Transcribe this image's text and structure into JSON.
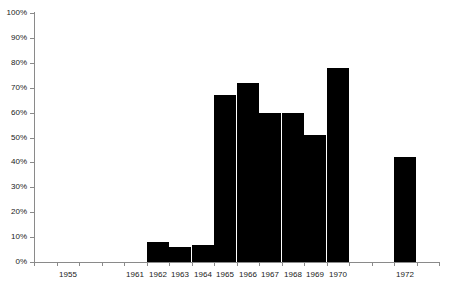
{
  "chart_data": {
    "type": "bar",
    "title": "",
    "subtitle": "",
    "xlabel": "",
    "ylabel": "",
    "grid": false,
    "legend": "none",
    "ylim": [
      0,
      100
    ],
    "y_unit": "%",
    "y_ticks": [
      "0%",
      "10%",
      "20%",
      "30%",
      "40%",
      "50%",
      "60%",
      "70%",
      "80%",
      "90%",
      "100%"
    ],
    "y_tick_values": [
      0,
      10,
      20,
      30,
      40,
      50,
      60,
      70,
      80,
      90,
      100
    ],
    "categories": [
      "1955",
      "1961",
      "1962",
      "1963",
      "1964",
      "1965",
      "1966",
      "1967",
      "1968",
      "1969",
      "1970",
      "1972"
    ],
    "values": [
      0,
      0,
      8,
      6,
      7,
      67,
      72,
      60,
      60,
      51,
      78,
      42
    ],
    "bars": [
      {
        "category": "1955",
        "value": 0,
        "label": "0%",
        "has_bar": false
      },
      {
        "category": "1961",
        "value": 0,
        "label": "0%",
        "has_bar": false
      },
      {
        "category": "1962",
        "value": 8,
        "label": "8%",
        "has_bar": true
      },
      {
        "category": "1963",
        "value": 6,
        "label": "6%",
        "has_bar": true
      },
      {
        "category": "1964",
        "value": 7,
        "label": "7%",
        "has_bar": true
      },
      {
        "category": "1965",
        "value": 67,
        "label": "67%",
        "has_bar": true
      },
      {
        "category": "1966",
        "value": 72,
        "label": "72%",
        "has_bar": true
      },
      {
        "category": "1967",
        "value": 60,
        "label": "60%",
        "has_bar": true
      },
      {
        "category": "1968",
        "value": 60,
        "label": "60%",
        "has_bar": true
      },
      {
        "category": "1969",
        "value": 51,
        "label": "51%",
        "has_bar": true
      },
      {
        "category": "1970",
        "value": 78,
        "label": "78%",
        "has_bar": true
      },
      {
        "category": "1972",
        "value": 42,
        "label": "42%",
        "has_bar": true
      }
    ],
    "hidden_tick_slots": 6,
    "series": [
      {
        "name": "",
        "values": [
          0,
          0,
          8,
          6,
          7,
          67,
          72,
          60,
          60,
          51,
          78,
          42
        ]
      }
    ],
    "colors": {
      "bar_fill": "#000000",
      "axis": "#8a8a8a",
      "text": "#1a1a1a",
      "background": "#ffffff"
    }
  },
  "layout": {
    "axis_x_px": 34,
    "axis_top_px": 13,
    "axis_baseline_px": 262,
    "plot_width_px": 405,
    "bar_width_px": 22,
    "slot_positions": [
      62,
      140,
      175,
      210,
      245,
      280,
      315,
      350,
      385,
      420,
      455,
      524
    ]
  }
}
